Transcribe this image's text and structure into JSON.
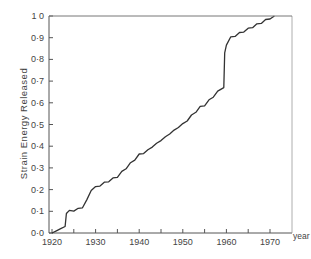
{
  "chart_data": {
    "type": "line",
    "title": "",
    "xlabel": "year",
    "ylabel": "Strain Energy Released",
    "xlim": [
      1920,
      1975
    ],
    "ylim": [
      0.0,
      1.0
    ],
    "grid": false,
    "legend": null,
    "x_ticks": [
      1920,
      1925,
      1930,
      1935,
      1940,
      1945,
      1950,
      1955,
      1960,
      1965,
      1970
    ],
    "x_tick_labels": [
      "1920",
      "",
      "1930",
      "",
      "1940",
      "",
      "1950",
      "",
      "1960",
      "",
      "1970"
    ],
    "y_ticks": [
      0.0,
      0.1,
      0.2,
      0.3,
      0.4,
      0.5,
      0.6,
      0.7,
      0.8,
      0.9,
      1.0
    ],
    "y_tick_labels": [
      "0·0",
      "0·1",
      "0·2",
      "0·3",
      "0·4",
      "0·5",
      "0·6",
      "0·7",
      "0·8",
      "0·9",
      "1 0"
    ],
    "series": [
      {
        "name": "Cumulative strain energy released",
        "x": [
          1920,
          1921,
          1922,
          1923,
          1923.3,
          1924,
          1925,
          1926,
          1927,
          1928,
          1929,
          1930,
          1931,
          1932,
          1933,
          1934,
          1935,
          1936,
          1937,
          1938,
          1939,
          1940,
          1941,
          1942,
          1943,
          1944,
          1945,
          1946,
          1947,
          1948,
          1949,
          1950,
          1951,
          1952,
          1953,
          1954,
          1955,
          1956,
          1957,
          1958,
          1959.4,
          1959.6,
          1960,
          1961,
          1962,
          1963,
          1964,
          1965,
          1966,
          1967,
          1968,
          1969,
          1970,
          1971
        ],
        "values": [
          0.0,
          0.01,
          0.02,
          0.03,
          0.09,
          0.1,
          0.105,
          0.11,
          0.12,
          0.15,
          0.2,
          0.21,
          0.22,
          0.23,
          0.24,
          0.25,
          0.26,
          0.28,
          0.3,
          0.32,
          0.34,
          0.36,
          0.37,
          0.38,
          0.4,
          0.41,
          0.43,
          0.44,
          0.46,
          0.47,
          0.49,
          0.5,
          0.52,
          0.54,
          0.56,
          0.58,
          0.59,
          0.61,
          0.63,
          0.65,
          0.67,
          0.83,
          0.87,
          0.9,
          0.91,
          0.92,
          0.93,
          0.94,
          0.95,
          0.96,
          0.97,
          0.98,
          0.99,
          1.0
        ]
      }
    ],
    "upper_line": {
      "y": 1.0,
      "from_x": 1920,
      "to_x": 1975
    }
  },
  "layout": {
    "plot_px": {
      "left": 49,
      "top": 16,
      "right": 292,
      "bottom": 233
    },
    "x_px_1920": 52,
    "x_px_1970": 270,
    "line_color": "#333333",
    "axis_color": "#555555"
  }
}
